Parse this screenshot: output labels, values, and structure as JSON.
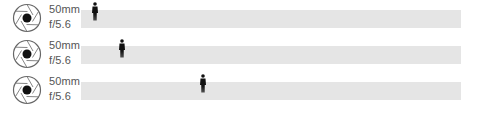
{
  "rows": [
    {
      "focal_length": "50mm",
      "aperture": "f/5.6",
      "subject_position_px": 10,
      "icon": "aperture-icon",
      "subject_icon": "person-icon"
    },
    {
      "focal_length": "50mm",
      "aperture": "f/5.6",
      "subject_position_px": 37,
      "icon": "aperture-icon",
      "subject_icon": "person-icon"
    },
    {
      "focal_length": "50mm",
      "aperture": "f/5.6",
      "subject_position_px": 119,
      "icon": "aperture-icon",
      "subject_icon": "person-icon"
    }
  ],
  "colors": {
    "bar": "#e5e5e5",
    "text": "#555555",
    "figure": "#111111",
    "icon": "#555555"
  }
}
